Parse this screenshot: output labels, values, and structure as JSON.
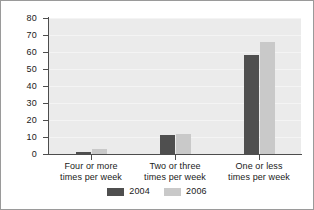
{
  "chart_data": {
    "type": "bar",
    "title": "",
    "xlabel": "",
    "ylabel": "",
    "ylim": [
      0,
      80
    ],
    "ytick_step": 10,
    "yticks": [
      "80",
      "70",
      "60",
      "50",
      "40",
      "30",
      "20",
      "10",
      "0"
    ],
    "grid": true,
    "legend_position": "bottom",
    "categories": [
      "Four or more\ntimes per week",
      "Two or three\ntimes per week",
      "One or less\ntimes per week"
    ],
    "category_lines": [
      [
        "Four or more",
        "times per week"
      ],
      [
        "Two or three",
        "times per week"
      ],
      [
        "One or less",
        "times per week"
      ]
    ],
    "series": [
      {
        "name": "2004",
        "color": "#4f4f4f",
        "values": [
          1,
          11,
          58
        ]
      },
      {
        "name": "2006",
        "color": "#c9c9c9",
        "values": [
          3,
          12,
          66
        ]
      }
    ]
  },
  "legend": {
    "entries": [
      {
        "label": "2004",
        "color": "#4f4f4f"
      },
      {
        "label": "2006",
        "color": "#c9c9c9"
      }
    ]
  },
  "colors": {
    "plot_background": "#ebebeb",
    "figure_background": "#ffffff",
    "axis": "#4d4d4d",
    "gridline": "#f4f4f4",
    "border": "#9a9a9a",
    "text": "#1a1a1a"
  }
}
